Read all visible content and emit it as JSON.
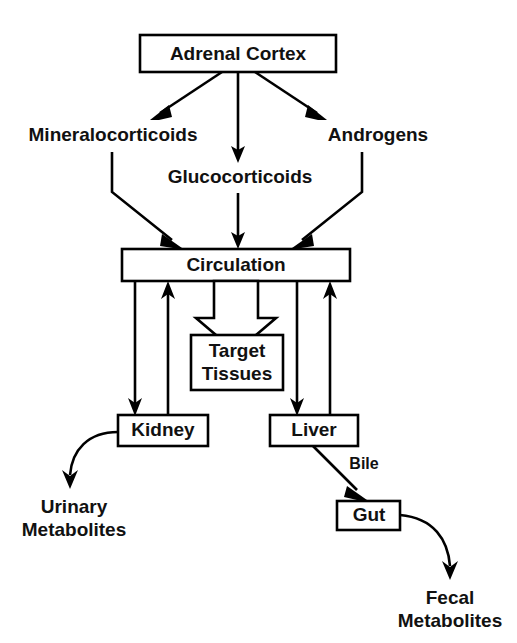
{
  "diagram": {
    "nodes": {
      "adrenal_cortex": {
        "label": "Adrenal Cortex"
      },
      "mineralocorticoids": {
        "label": "Mineralocorticoids"
      },
      "glucocorticoids": {
        "label": "Glucocorticoids"
      },
      "androgens": {
        "label": "Androgens"
      },
      "circulation": {
        "label": "Circulation"
      },
      "target_tissues": {
        "label_line1": "Target",
        "label_line2": "Tissues"
      },
      "kidney": {
        "label": "Kidney"
      },
      "liver": {
        "label": "Liver"
      },
      "gut": {
        "label": "Gut"
      },
      "urinary_metabolites": {
        "label_line1": "Urinary",
        "label_line2": "Metabolites"
      },
      "fecal_metabolites": {
        "label_line1": "Fecal",
        "label_line2": "Metabolites"
      }
    },
    "edge_labels": {
      "bile": "Bile"
    },
    "colors": {
      "stroke": "#000000",
      "fill": "#ffffff",
      "text": "#111111"
    }
  }
}
